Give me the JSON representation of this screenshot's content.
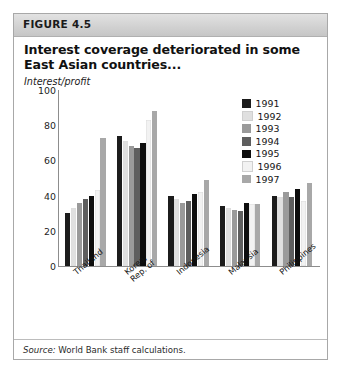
{
  "figure": {
    "label": "FIGURE 4.5",
    "title": "Interest coverage deteriorated in some East Asian countries...",
    "source_word": "Source:",
    "source_text": " World Bank staff calculations."
  },
  "legend": {
    "items": [
      {
        "label": "1991",
        "color": "#1c1c1c"
      },
      {
        "label": "1992",
        "color": "#e0e0e0"
      },
      {
        "label": "1993",
        "color": "#9a9a9a"
      },
      {
        "label": "1994",
        "color": "#5e5e5e"
      },
      {
        "label": "1995",
        "color": "#0d0d0d"
      },
      {
        "label": "1996",
        "color": "#f2f2f2"
      },
      {
        "label": "1997",
        "color": "#a8a8a8"
      }
    ]
  },
  "chart_data": {
    "type": "bar",
    "title": "Interest coverage deteriorated in some East Asian countries...",
    "ylabel": "Interest/profit",
    "xlabel": "",
    "ylim": [
      0,
      100
    ],
    "yticks": [
      0,
      20,
      40,
      60,
      80,
      100
    ],
    "ytick_labels": [
      "0",
      "20",
      "40",
      "60",
      "80",
      "100"
    ],
    "grid": false,
    "legend_position": "top-right",
    "categories": [
      "Thailand",
      "Korea, Rep. of",
      "Indonesia",
      "Malaysia",
      "Philippines"
    ],
    "category_lines": [
      [
        "Thailand"
      ],
      [
        "Korea,",
        "Rep. of"
      ],
      [
        "Indonesia"
      ],
      [
        "Malaysia"
      ],
      [
        "Philippines"
      ]
    ],
    "series": [
      {
        "name": "1991",
        "color": "#1c1c1c",
        "values": [
          30,
          74,
          40,
          34,
          40
        ]
      },
      {
        "name": "1992",
        "color": "#e0e0e0",
        "values": [
          33,
          71,
          38,
          33,
          39
        ]
      },
      {
        "name": "1993",
        "color": "#9a9a9a",
        "values": [
          36,
          68,
          36,
          32,
          42
        ]
      },
      {
        "name": "1994",
        "color": "#5e5e5e",
        "values": [
          38,
          67,
          37,
          31,
          39
        ]
      },
      {
        "name": "1995",
        "color": "#0d0d0d",
        "values": [
          40,
          70,
          41,
          36,
          44
        ]
      },
      {
        "name": "1996",
        "color": "#f2f2f2",
        "values": [
          43,
          83,
          42,
          35,
          37
        ]
      },
      {
        "name": "1997",
        "color": "#a8a8a8",
        "values": [
          73,
          88,
          49,
          35,
          47
        ]
      }
    ]
  }
}
